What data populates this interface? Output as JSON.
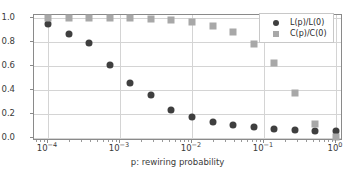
{
  "chart_data": {
    "type": "scatter",
    "title": "",
    "xlabel": "p: rewiring probability",
    "ylabel": "",
    "xscale": "log",
    "yscale": "linear",
    "xlim": [
      7e-05,
      1.45
    ],
    "ylim": [
      -0.05,
      1.05
    ],
    "grid": true,
    "legend_position": "upper right",
    "xticks": [
      {
        "value": 0.0001,
        "label": "10",
        "exponent": "−4"
      },
      {
        "value": 0.001,
        "label": "10",
        "exponent": "−3"
      },
      {
        "value": 0.01,
        "label": "10",
        "exponent": "−2"
      },
      {
        "value": 0.1,
        "label": "10",
        "exponent": "−1"
      },
      {
        "value": 1.0,
        "label": "10",
        "exponent": "0"
      }
    ],
    "yticks": [
      {
        "value": 0.0,
        "label": "0.0"
      },
      {
        "value": 0.2,
        "label": "0.2"
      },
      {
        "value": 0.4,
        "label": "0.4"
      },
      {
        "value": 0.6,
        "label": "0.6"
      },
      {
        "value": 0.8,
        "label": "0.8"
      },
      {
        "value": 1.0,
        "label": "1.0"
      }
    ],
    "x": [
      0.0001,
      0.000193,
      0.000373,
      0.00072,
      0.00139,
      0.00268,
      0.00518,
      0.01,
      0.0193,
      0.0373,
      0.072,
      0.139,
      0.268,
      0.518,
      1.0
    ],
    "series": [
      {
        "name": "L(p)/L(0)",
        "marker": "circle",
        "color": "#3f3f3f",
        "values": [
          0.95,
          0.87,
          0.79,
          0.605,
          0.455,
          0.36,
          0.235,
          0.175,
          0.135,
          0.11,
          0.092,
          0.077,
          0.068,
          0.06,
          0.058
        ]
      },
      {
        "name": "C(p)/C(0)",
        "marker": "square",
        "color": "#a8a8a8",
        "values": [
          1.0,
          1.0,
          1.0,
          1.0,
          0.999,
          0.995,
          0.985,
          0.97,
          0.935,
          0.885,
          0.785,
          0.625,
          0.375,
          0.115,
          0.005
        ]
      }
    ]
  },
  "legend": {
    "entries": [
      {
        "label": "L(p)/L(0)"
      },
      {
        "label": "C(p)/C(0)"
      }
    ]
  },
  "colors": {
    "series_l": "#3f3f3f",
    "series_c": "#a8a8a8",
    "grid": "#d4d4d4",
    "frame": "#8a8a8a",
    "background": "#ffffff",
    "text": "#3a3a3a"
  }
}
